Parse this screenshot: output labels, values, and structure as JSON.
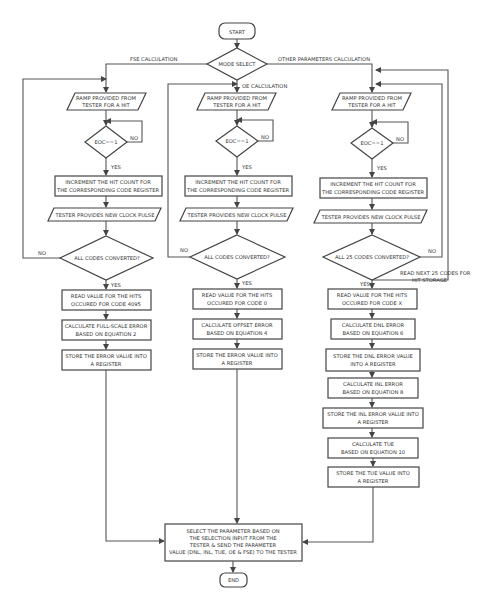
{
  "diagram": {
    "type": "flowchart",
    "start": "START",
    "end": "END",
    "mode_select": "MODE SELECT",
    "branch_labels": {
      "fse": "FSE CALCULATION",
      "oe": "OE CALCULATION",
      "other": "OTHER PARAMETERS CALCULATION"
    },
    "common": {
      "ramp_l1": "RAMP PROVIDED FROM",
      "ramp_l2": "TESTER FOR A HIT",
      "eoc": "EOC==1",
      "no": "NO",
      "yes": "YES",
      "inc_l1": "INCREMENT THE HIT COUNT FOR",
      "inc_l2": "THE CORRESPONDING CODE REGISTER",
      "clock": "TESTER PROVIDES NEW CLOCK PULSE",
      "all_codes": "ALL CODES CONVERTED?",
      "store_l1": "STORE THE ERROR VALUE INTO",
      "store_l2": "A REGISTER"
    },
    "fse": {
      "read_l1": "READ VALUE FOR THE HITS",
      "read_l2": "OCCURED FOR CODE 4095",
      "calc_l1": "CALCULATE FULL-SCALE ERROR",
      "calc_l2": "BASED ON EQUATION 2"
    },
    "oe": {
      "read_l1": "READ VALUE FOR THE HITS",
      "read_l2": "OCCURED FOR CODE 0",
      "calc_l1": "CALCULATE OFFSET ERROR",
      "calc_l2": "BASED ON EQUATION 4"
    },
    "other": {
      "all_codes": "ALL 25 CODES CONVERTED?",
      "next_l1": "READ NEXT 25 CODES FOR",
      "next_l2": "HIT STORAGE",
      "read_l1": "READ VALUE FOR THE HITS",
      "read_l2": "OCCURED FOR CODE X",
      "dnl_calc_l1": "CALCULATE DNL ERROR",
      "dnl_calc_l2": "BASED ON EQUATION 6",
      "dnl_store_l1": "STORE THE DNL ERROR VALUE",
      "dnl_store_l2": "INTO A REGISTER",
      "inl_calc_l1": "CALCULATE INL ERROR",
      "inl_calc_l2": "BASED ON EQUATION 8",
      "inl_store_l1": "STORE THE INL ERROR VALUE INTO",
      "inl_store_l2": "A REGISTER",
      "tue_calc_l1": "CALCULATE TUE",
      "tue_calc_l2": "BASED ON EQUATION 10",
      "tue_store_l1": "STORE THE TUE VALUE INTO",
      "tue_store_l2": "A REGISTER"
    },
    "final": {
      "l1": "SELECT THE PARAMETER BASED ON",
      "l2": "THE SELECTION INPUT FROM THE",
      "l3": "TESTER & SEND THE PARAMETER",
      "l4": "VALUE (DNL, INL, TUE, OE & FSE) TO THE TESTER"
    }
  }
}
